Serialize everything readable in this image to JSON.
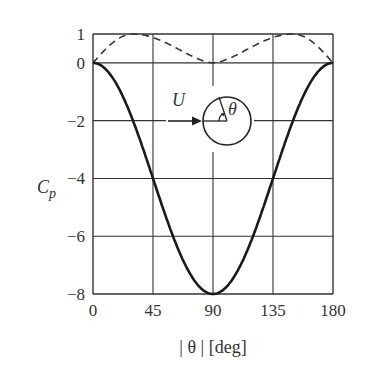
{
  "chart_data": {
    "type": "line",
    "title": "",
    "xlabel": "| θ | [deg]",
    "ylabel": "C_p",
    "xlim": [
      0,
      180
    ],
    "ylim": [
      -8,
      1
    ],
    "x_ticks": [
      "0",
      "45",
      "90",
      "135",
      "180"
    ],
    "y_ticks": [
      "1",
      "0",
      "−2",
      "−4",
      "−6",
      "−8"
    ],
    "grid": true,
    "legend": null,
    "series": [
      {
        "name": "solid",
        "style": "solid",
        "x": [
          0,
          15,
          30,
          45,
          60,
          75,
          90,
          105,
          120,
          135,
          150,
          165,
          180
        ],
        "values": [
          0,
          -0.54,
          -2.0,
          -4.0,
          -6.0,
          -7.46,
          -8.0,
          -7.46,
          -6.0,
          -4.0,
          -2.0,
          -0.54,
          0
        ]
      },
      {
        "name": "dashed",
        "style": "dashed",
        "x": [
          0,
          15,
          30,
          45,
          60,
          75,
          90,
          105,
          120,
          135,
          150,
          165,
          180
        ],
        "values": [
          0,
          0.7,
          1.0,
          0.85,
          0.5,
          0.15,
          0,
          0.15,
          0.5,
          0.85,
          1.0,
          0.7,
          0
        ]
      }
    ],
    "annotations": [
      {
        "text": "U",
        "kind": "flow-velocity-label"
      },
      {
        "text": "θ",
        "kind": "angle-label"
      },
      {
        "kind": "cylinder-inset-with-flow-arrow"
      }
    ]
  },
  "labels": {
    "x_axis": "| θ | [deg]",
    "y_axis_main": "C",
    "y_axis_sub": "p",
    "inset_U": "U",
    "inset_theta": "θ"
  }
}
